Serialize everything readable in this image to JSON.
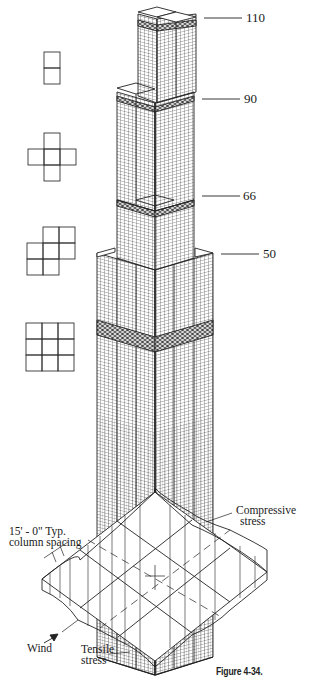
{
  "figure": {
    "caption": "Figure 4-34."
  },
  "tower": {
    "floor_labels": [
      {
        "label": "110",
        "y": 18
      },
      {
        "label": "90",
        "y": 99
      },
      {
        "label": "66",
        "y": 196
      },
      {
        "label": "50",
        "y": 254
      }
    ]
  },
  "plans": [
    {
      "name": "plan-2-tubes",
      "cells": [
        [
          0,
          0
        ],
        [
          0,
          1
        ]
      ]
    },
    {
      "name": "plan-5-tubes-cross",
      "cells": [
        [
          1,
          0
        ],
        [
          0,
          1
        ],
        [
          1,
          1
        ],
        [
          2,
          1
        ],
        [
          1,
          2
        ]
      ]
    },
    {
      "name": "plan-7-tubes",
      "cells": [
        [
          1,
          0
        ],
        [
          2,
          0
        ],
        [
          0,
          1
        ],
        [
          1,
          1
        ],
        [
          2,
          1
        ],
        [
          0,
          2
        ],
        [
          1,
          2
        ]
      ]
    },
    {
      "name": "plan-9-tubes",
      "cells": [
        [
          0,
          0
        ],
        [
          1,
          0
        ],
        [
          2,
          0
        ],
        [
          0,
          1
        ],
        [
          1,
          1
        ],
        [
          2,
          1
        ],
        [
          0,
          2
        ],
        [
          1,
          2
        ],
        [
          2,
          2
        ]
      ]
    }
  ],
  "stress_diagram": {
    "column_spacing_line1": "15' - 0\" Typ.",
    "column_spacing_line2": "column spacing",
    "compressive_line1": "Compressive",
    "compressive_line2": "stress",
    "tensile_line1": "Tensile",
    "tensile_line2": "stress",
    "wind": "Wind"
  }
}
